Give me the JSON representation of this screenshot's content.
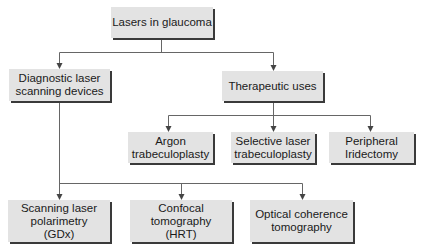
{
  "diagram": {
    "root": {
      "label": "Lasers in glaucoma"
    },
    "level1": [
      {
        "label": "Diagnostic laser\nscanning devices"
      },
      {
        "label": "Therapeutic uses"
      }
    ],
    "therapeutic_children": [
      {
        "label": "Argon\ntrabeculoplasty"
      },
      {
        "label": "Selective laser\ntrabeculoplasty"
      },
      {
        "label": "Peripheral\nIridectomy"
      }
    ],
    "diagnostic_children": [
      {
        "label": "Scanning laser\npolarimetry\n(GDx)"
      },
      {
        "label": "Confocal\ntomography\n(HRT)"
      },
      {
        "label": "Optical coherence\ntomography"
      }
    ]
  },
  "colors": {
    "box_fill": "#e3e3e3",
    "shadow": "#3a3a3a",
    "line": "#555555"
  }
}
